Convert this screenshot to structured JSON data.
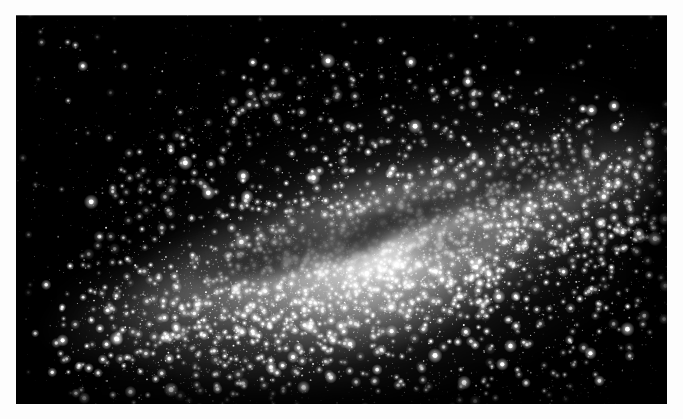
{
  "document": {
    "kind": "astronomical-photograph",
    "subject": "Milky Way galactic center",
    "caption": "",
    "orientation": "landscape"
  },
  "page": {
    "background_color": "#fdfdfd",
    "width": 683,
    "height": 419
  },
  "photo": {
    "alt_text": "Wide-field grayscale photograph of the Milky Way galactic centre: a dense luminous star cloud crossed by dark dust lanes on a black sky.",
    "frame": {
      "left": 16,
      "top": 15,
      "width": 651,
      "height": 389
    },
    "sky_color": "#000000",
    "star_color": "#ffffff",
    "glow_color": "#e8e8e8",
    "dust_color": "#0a0a0a",
    "tone": "monochrome"
  },
  "chart_data": {
    "type": "scatter",
    "xlabel": "",
    "ylabel": "",
    "xlim": [
      0,
      651
    ],
    "ylim": [
      0,
      389
    ],
    "grid": false,
    "legend": "none",
    "core": {
      "x": 364,
      "y": 242,
      "peak_brightness": 1.0
    },
    "plane": {
      "description": "Galactic plane band, tilted; runs from lower-left to upper-right.",
      "angle_deg": -17,
      "center_x": 360,
      "center_y": 250,
      "half_length": 330,
      "half_width": 74
    },
    "bulge": {
      "description": "Central bulge halo of scattered stars around the core.",
      "center_x": 360,
      "center_y": 245,
      "radius_x": 300,
      "radius_y": 200
    },
    "glow_nodes": [
      {
        "x": 364,
        "y": 244,
        "rx": 96,
        "ry": 54,
        "alpha": 0.95,
        "label": "core-bulge"
      },
      {
        "x": 330,
        "y": 252,
        "rx": 150,
        "ry": 60,
        "alpha": 0.52,
        "label": "inner-band"
      },
      {
        "x": 250,
        "y": 268,
        "rx": 130,
        "ry": 44,
        "alpha": 0.34,
        "label": "west-band"
      },
      {
        "x": 160,
        "y": 280,
        "rx": 90,
        "ry": 34,
        "alpha": 0.22,
        "label": "far-west-band"
      },
      {
        "x": 455,
        "y": 215,
        "rx": 120,
        "ry": 52,
        "alpha": 0.34,
        "label": "east-band"
      },
      {
        "x": 545,
        "y": 175,
        "rx": 100,
        "ry": 44,
        "alpha": 0.24,
        "label": "far-east-band"
      },
      {
        "x": 610,
        "y": 150,
        "rx": 70,
        "ry": 34,
        "alpha": 0.14,
        "label": "outer-east"
      },
      {
        "x": 360,
        "y": 300,
        "rx": 180,
        "ry": 60,
        "alpha": 0.2,
        "label": "south-halo"
      },
      {
        "x": 370,
        "y": 185,
        "rx": 170,
        "ry": 60,
        "alpha": 0.18,
        "label": "north-halo"
      }
    ],
    "dust_lanes": [
      {
        "x": 300,
        "y": 228,
        "rx": 58,
        "ry": 17,
        "angle_deg": -14,
        "alpha": 0.62,
        "label": "great-rift-west"
      },
      {
        "x": 372,
        "y": 206,
        "rx": 34,
        "ry": 13,
        "angle_deg": -24,
        "alpha": 0.7,
        "label": "pipe-nebula"
      },
      {
        "x": 412,
        "y": 196,
        "rx": 26,
        "ry": 11,
        "angle_deg": -30,
        "alpha": 0.55,
        "label": "dark-horse"
      },
      {
        "x": 470,
        "y": 176,
        "rx": 44,
        "ry": 14,
        "angle_deg": -22,
        "alpha": 0.5,
        "label": "rift-east"
      },
      {
        "x": 530,
        "y": 152,
        "rx": 40,
        "ry": 13,
        "angle_deg": -20,
        "alpha": 0.45,
        "label": "rift-far-east"
      },
      {
        "x": 236,
        "y": 250,
        "rx": 40,
        "ry": 12,
        "angle_deg": -10,
        "alpha": 0.48,
        "label": "rift-far-west"
      },
      {
        "x": 338,
        "y": 232,
        "rx": 22,
        "ry": 9,
        "angle_deg": -18,
        "alpha": 0.42,
        "label": "core-dark-patch"
      },
      {
        "x": 432,
        "y": 228,
        "rx": 30,
        "ry": 10,
        "angle_deg": -12,
        "alpha": 0.38,
        "label": "south-rift"
      }
    ],
    "star_counts": {
      "plane_dense": 5200,
      "bulge_scatter": 2600,
      "field_sparse": 900,
      "bright_foreground": 170,
      "total": 8870
    },
    "magnitude_distribution": {
      "bins": [
        "brightest",
        "bright",
        "medium",
        "faint",
        "very-faint"
      ],
      "counts": [
        170,
        640,
        1850,
        3100,
        3110
      ]
    }
  },
  "random": {
    "seed": 20240617
  }
}
